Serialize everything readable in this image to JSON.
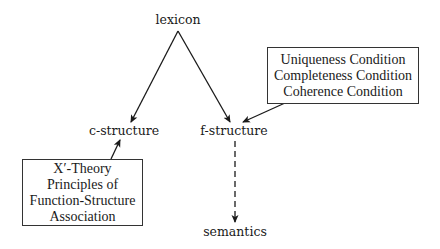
{
  "nodes": {
    "lexicon": "lexicon",
    "c_structure": "c-structure",
    "f_structure": "f-structure",
    "semantics": "semantics"
  },
  "boxes": {
    "conditions": {
      "lines": [
        "Uniqueness Condition",
        "Completeness Condition",
        "Coherence Condition"
      ]
    },
    "c_structure_constraints": {
      "lines": [
        "X′-Theory",
        "Principles of",
        "Function-Structure",
        "Association"
      ]
    }
  },
  "edges": [
    {
      "from": "lexicon",
      "to": "c-structure",
      "style": "solid"
    },
    {
      "from": "lexicon",
      "to": "f-structure",
      "style": "solid"
    },
    {
      "from": "conditions-box",
      "to": "f-structure",
      "style": "solid"
    },
    {
      "from": "x-bar-theory-box",
      "to": "c-structure",
      "style": "solid"
    },
    {
      "from": "f-structure",
      "to": "semantics",
      "style": "dashed"
    }
  ],
  "colors": {
    "line": "#1a1a1a",
    "text": "#1a1a1a",
    "background": "#ffffff"
  }
}
